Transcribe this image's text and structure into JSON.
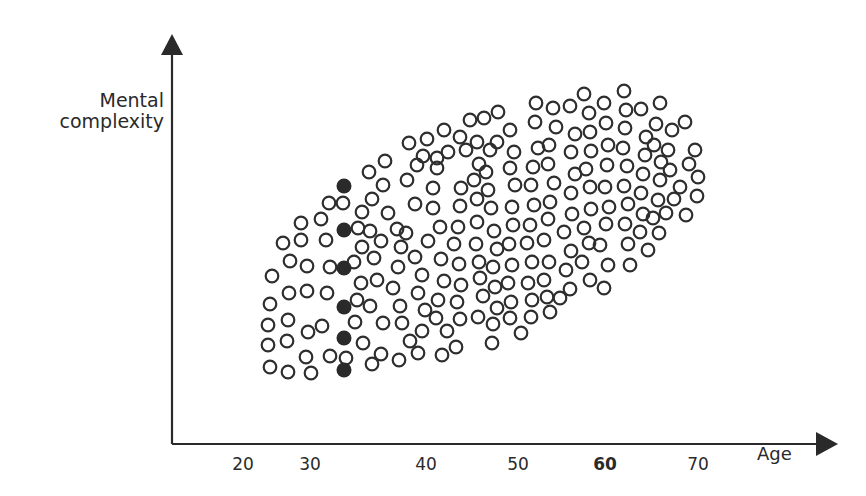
{
  "chart_data": {
    "type": "scatter",
    "title": "",
    "xlabel": "Age",
    "ylabel": "Mental complexity",
    "x_ticks": [
      "20",
      "30",
      "40",
      "50",
      "60",
      "70"
    ],
    "x_tick_emphasized": "60",
    "xlim": [
      13,
      85
    ],
    "y_ticks": [],
    "grid": false,
    "legend": null,
    "highlighted_points": {
      "style": "filled",
      "age": 31,
      "pixel_x": 344,
      "pixel_y": [
        186,
        230,
        268,
        307,
        338,
        370
      ]
    },
    "axis": {
      "origin": [
        172,
        444
      ],
      "y_top": 34,
      "x_right": 836,
      "tick_pixels": {
        "20": 243,
        "30": 310,
        "40": 426,
        "50": 518,
        "60": 605,
        "70": 698
      }
    },
    "hollow_points_px": [
      [
        270,
        367
      ],
      [
        288,
        372
      ],
      [
        311,
        373
      ],
      [
        268,
        345
      ],
      [
        287,
        341
      ],
      [
        306,
        357
      ],
      [
        330,
        356
      ],
      [
        268,
        325
      ],
      [
        288,
        320
      ],
      [
        308,
        332
      ],
      [
        322,
        326
      ],
      [
        270,
        304
      ],
      [
        289,
        293
      ],
      [
        307,
        291
      ],
      [
        327,
        293
      ],
      [
        272,
        276
      ],
      [
        290,
        261
      ],
      [
        307,
        266
      ],
      [
        330,
        267
      ],
      [
        283,
        243
      ],
      [
        301,
        240
      ],
      [
        326,
        240
      ],
      [
        301,
        223
      ],
      [
        321,
        219
      ],
      [
        329,
        203
      ],
      [
        343,
        203
      ],
      [
        362,
        212
      ],
      [
        358,
        228
      ],
      [
        362,
        247
      ],
      [
        354,
        262
      ],
      [
        361,
        283
      ],
      [
        357,
        300
      ],
      [
        355,
        322
      ],
      [
        346,
        358
      ],
      [
        363,
        343
      ],
      [
        372,
        364
      ],
      [
        381,
        354
      ],
      [
        383,
        323
      ],
      [
        370,
        306
      ],
      [
        377,
        280
      ],
      [
        374,
        258
      ],
      [
        381,
        241
      ],
      [
        370,
        231
      ],
      [
        372,
        199
      ],
      [
        383,
        185
      ],
      [
        385,
        161
      ],
      [
        369,
        172
      ],
      [
        388,
        213
      ],
      [
        397,
        229
      ],
      [
        401,
        247
      ],
      [
        398,
        267
      ],
      [
        393,
        288
      ],
      [
        400,
        306
      ],
      [
        402,
        323
      ],
      [
        410,
        341
      ],
      [
        399,
        360
      ],
      [
        418,
        353
      ],
      [
        422,
        331
      ],
      [
        425,
        310
      ],
      [
        418,
        293
      ],
      [
        422,
        275
      ],
      [
        415,
        257
      ],
      [
        406,
        233
      ],
      [
        415,
        204
      ],
      [
        407,
        180
      ],
      [
        409,
        143
      ],
      [
        423,
        156
      ],
      [
        427,
        139
      ],
      [
        417,
        165
      ],
      [
        433,
        188
      ],
      [
        437,
        168
      ],
      [
        444,
        130
      ],
      [
        437,
        158
      ],
      [
        433,
        208
      ],
      [
        440,
        227
      ],
      [
        428,
        241
      ],
      [
        441,
        259
      ],
      [
        444,
        281
      ],
      [
        438,
        300
      ],
      [
        436,
        318
      ],
      [
        447,
        331
      ],
      [
        456,
        347
      ],
      [
        442,
        355
      ],
      [
        460,
        319
      ],
      [
        457,
        302
      ],
      [
        461,
        285
      ],
      [
        459,
        264
      ],
      [
        454,
        244
      ],
      [
        458,
        227
      ],
      [
        460,
        206
      ],
      [
        461,
        188
      ],
      [
        448,
        152
      ],
      [
        460,
        137
      ],
      [
        470,
        120
      ],
      [
        466,
        150
      ],
      [
        477,
        142
      ],
      [
        479,
        164
      ],
      [
        474,
        180
      ],
      [
        477,
        199
      ],
      [
        477,
        222
      ],
      [
        476,
        244
      ],
      [
        479,
        262
      ],
      [
        480,
        278
      ],
      [
        483,
        296
      ],
      [
        478,
        317
      ],
      [
        492,
        343
      ],
      [
        493,
        324
      ],
      [
        497,
        308
      ],
      [
        495,
        287
      ],
      [
        493,
        267
      ],
      [
        497,
        249
      ],
      [
        494,
        231
      ],
      [
        491,
        208
      ],
      [
        488,
        190
      ],
      [
        486,
        172
      ],
      [
        490,
        150
      ],
      [
        498,
        112
      ],
      [
        484,
        118
      ],
      [
        497,
        142
      ],
      [
        510,
        130
      ],
      [
        514,
        152
      ],
      [
        510,
        168
      ],
      [
        515,
        185
      ],
      [
        512,
        207
      ],
      [
        513,
        225
      ],
      [
        509,
        244
      ],
      [
        512,
        265
      ],
      [
        508,
        283
      ],
      [
        511,
        302
      ],
      [
        510,
        318
      ],
      [
        521,
        333
      ],
      [
        531,
        317
      ],
      [
        532,
        300
      ],
      [
        528,
        283
      ],
      [
        532,
        262
      ],
      [
        527,
        243
      ],
      [
        530,
        225
      ],
      [
        534,
        205
      ],
      [
        531,
        185
      ],
      [
        533,
        167
      ],
      [
        538,
        148
      ],
      [
        535,
        122
      ],
      [
        536,
        103
      ],
      [
        553,
        108
      ],
      [
        556,
        127
      ],
      [
        549,
        145
      ],
      [
        548,
        164
      ],
      [
        554,
        183
      ],
      [
        550,
        202
      ],
      [
        548,
        219
      ],
      [
        544,
        240
      ],
      [
        549,
        262
      ],
      [
        544,
        280
      ],
      [
        547,
        297
      ],
      [
        550,
        312
      ],
      [
        560,
        298
      ],
      [
        570,
        289
      ],
      [
        566,
        270
      ],
      [
        571,
        251
      ],
      [
        564,
        232
      ],
      [
        572,
        214
      ],
      [
        571,
        193
      ],
      [
        575,
        174
      ],
      [
        571,
        152
      ],
      [
        575,
        134
      ],
      [
        570,
        106
      ],
      [
        584,
        94
      ],
      [
        589,
        113
      ],
      [
        590,
        132
      ],
      [
        591,
        151
      ],
      [
        586,
        169
      ],
      [
        590,
        187
      ],
      [
        591,
        209
      ],
      [
        584,
        228
      ],
      [
        589,
        243
      ],
      [
        582,
        262
      ],
      [
        590,
        280
      ],
      [
        604,
        288
      ],
      [
        608,
        265
      ],
      [
        600,
        245
      ],
      [
        606,
        224
      ],
      [
        609,
        207
      ],
      [
        605,
        187
      ],
      [
        607,
        165
      ],
      [
        608,
        145
      ],
      [
        606,
        123
      ],
      [
        604,
        103
      ],
      [
        624,
        91
      ],
      [
        626,
        110
      ],
      [
        625,
        128
      ],
      [
        623,
        148
      ],
      [
        627,
        166
      ],
      [
        624,
        186
      ],
      [
        628,
        204
      ],
      [
        625,
        224
      ],
      [
        628,
        244
      ],
      [
        630,
        265
      ],
      [
        640,
        232
      ],
      [
        643,
        214
      ],
      [
        641,
        193
      ],
      [
        643,
        174
      ],
      [
        645,
        155
      ],
      [
        646,
        137
      ],
      [
        641,
        109
      ],
      [
        656,
        124
      ],
      [
        654,
        145
      ],
      [
        661,
        162
      ],
      [
        660,
        180
      ],
      [
        658,
        200
      ],
      [
        653,
        218
      ],
      [
        659,
        233
      ],
      [
        648,
        250
      ],
      [
        666,
        213
      ],
      [
        674,
        199
      ],
      [
        670,
        170
      ],
      [
        668,
        150
      ],
      [
        672,
        130
      ],
      [
        660,
        103
      ],
      [
        685,
        122
      ],
      [
        689,
        164
      ],
      [
        680,
        187
      ],
      [
        695,
        150
      ],
      [
        698,
        177
      ],
      [
        697,
        196
      ],
      [
        686,
        215
      ]
    ]
  }
}
